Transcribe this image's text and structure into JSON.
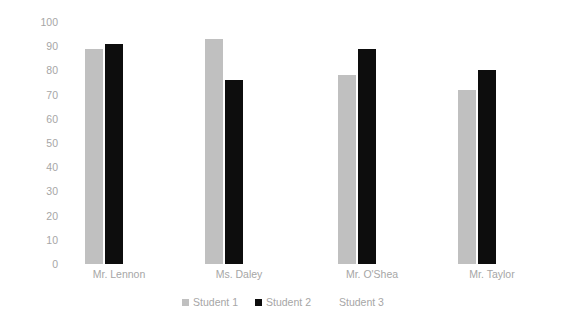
{
  "chart_data": {
    "type": "bar",
    "title": "",
    "subtitle": "",
    "xlabel": "",
    "ylabel": "",
    "categories": [
      "Mr. Lennon",
      "Ms. Daley",
      "Mr. O'Shea",
      "Mr. Taylor"
    ],
    "series": [
      {
        "name": "Student 1",
        "color": "#c0c0c0",
        "values": [
          89,
          93,
          78,
          72
        ]
      },
      {
        "name": "Student 2",
        "color": "#0d0d0d",
        "values": [
          91,
          76,
          89,
          80
        ]
      },
      {
        "name": "Student 3",
        "color": "#ffffff",
        "values": [
          0,
          0,
          0,
          0
        ]
      }
    ],
    "ylim": [
      0,
      100
    ],
    "y_ticks": [
      "100",
      "90",
      "80",
      "70",
      "60",
      "50",
      "40",
      "30",
      "20",
      "10",
      "0"
    ],
    "grid": false,
    "legend_position": "bottom",
    "axis_text_color": "#a6a6a6"
  }
}
